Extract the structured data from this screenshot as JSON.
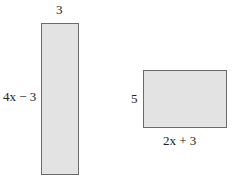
{
  "diagram": {
    "fill_color": "#e3e3e3",
    "stroke_color": "#6a6a6a",
    "shapes": [
      {
        "name": "tall-rectangle",
        "width_label": "3",
        "height_label": "4x − 3"
      },
      {
        "name": "wide-rectangle",
        "height_label": "5",
        "width_label": "2x + 3"
      }
    ]
  }
}
